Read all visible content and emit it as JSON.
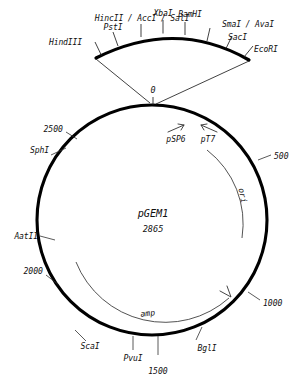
{
  "diagram": {
    "type": "plasmid-map",
    "plasmid_name": "pGEM1",
    "plasmid_size": "2865",
    "zero_label": "0"
  },
  "polylinker": {
    "sites": [
      {
        "name": "HindIII"
      },
      {
        "name": "PstI"
      },
      {
        "name": "HincII / AccI / SalI"
      },
      {
        "name": "XbaI"
      },
      {
        "name": "BamHI"
      },
      {
        "name": "SmaI / AvaI"
      },
      {
        "name": "SacI"
      },
      {
        "name": "EcoRI"
      }
    ]
  },
  "promoters": [
    {
      "name": "pSP6"
    },
    {
      "name": "pT7"
    }
  ],
  "genes": [
    {
      "name": "ori"
    },
    {
      "name": "amp"
    }
  ],
  "outer_sites": [
    {
      "name": "SphI"
    },
    {
      "name": "AatII"
    },
    {
      "name": "ScaI"
    },
    {
      "name": "PvuI"
    },
    {
      "name": "BglI"
    }
  ],
  "scale_ticks": [
    {
      "value": "500"
    },
    {
      "value": "1000"
    },
    {
      "value": "1500"
    },
    {
      "value": "2000"
    },
    {
      "value": "2500"
    }
  ],
  "colors": {
    "stroke": "#000000",
    "text": "#101010",
    "background": "#ffffff"
  }
}
